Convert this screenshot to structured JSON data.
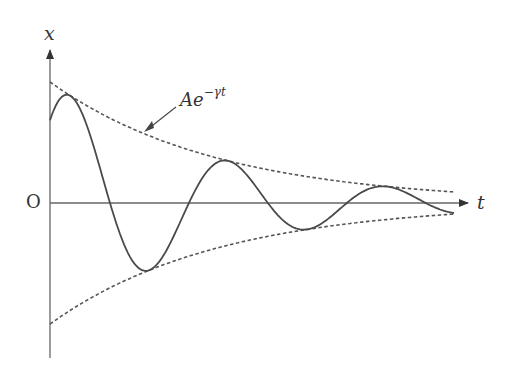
{
  "diagram": {
    "labels": {
      "y_axis": "x",
      "x_axis": "t",
      "origin": "O",
      "envelope_base": "Ae",
      "envelope_exp": "−γt"
    },
    "colors": {
      "curve": "#4a4a4a",
      "envelope": "#555555",
      "axis": "#666666"
    }
  },
  "chart_data": {
    "type": "line",
    "title": "",
    "xlabel": "t",
    "ylabel": "x",
    "series": [
      {
        "name": "x(t) = A e^{-γt} cos(ωt − φ)",
        "style": "solid",
        "params": {
          "A": 121,
          "gamma": 0.00592,
          "omega": 0.0398,
          "phi": 0.817
        }
      },
      {
        "name": "Ae^{-γt}",
        "style": "dashed"
      },
      {
        "name": "-Ae^{-γt}",
        "style": "dashed"
      }
    ],
    "key_points": {
      "start": [
        0,
        86
      ],
      "peaks": [
        [
          18,
          108
        ],
        [
          175,
          43
        ],
        [
          328,
          17
        ]
      ],
      "troughs": [
        [
          95,
          -67
        ],
        [
          252,
          -25
        ]
      ],
      "zeros": [
        60,
        139,
        218,
        300,
        375
      ]
    },
    "grid": false,
    "legend": "annotation arrow to upper envelope"
  }
}
